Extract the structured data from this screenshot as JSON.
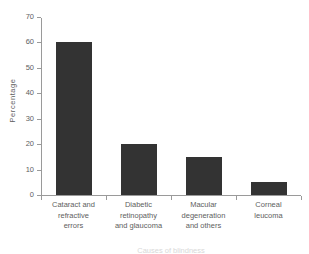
{
  "chart_data": {
    "type": "bar",
    "title": "",
    "xlabel": "",
    "ylabel": "Percentage",
    "ylim": [
      0,
      70
    ],
    "yticks": [
      0,
      10,
      20,
      30,
      40,
      50,
      60,
      70
    ],
    "grid": false,
    "legend": false,
    "orientation": "vertical",
    "bar_color": "#333333",
    "axis_color": "#9a9a9a",
    "text_color": "#5e5e5e",
    "categories": [
      "Cataract and refractive errors",
      "Diabetic retinopathy and glaucoma",
      "Macular degeneration and others",
      "Corneal leucoma"
    ],
    "category_lines": [
      [
        "Cataract and",
        "refractive",
        "errors"
      ],
      [
        "Diabetic",
        "retinopathy",
        "and glaucoma"
      ],
      [
        "Macular",
        "degeneration",
        "and others"
      ],
      [
        "Corneal",
        "leucoma"
      ]
    ],
    "values": [
      60,
      20,
      15,
      5
    ]
  },
  "caption": "Causes of blindness"
}
